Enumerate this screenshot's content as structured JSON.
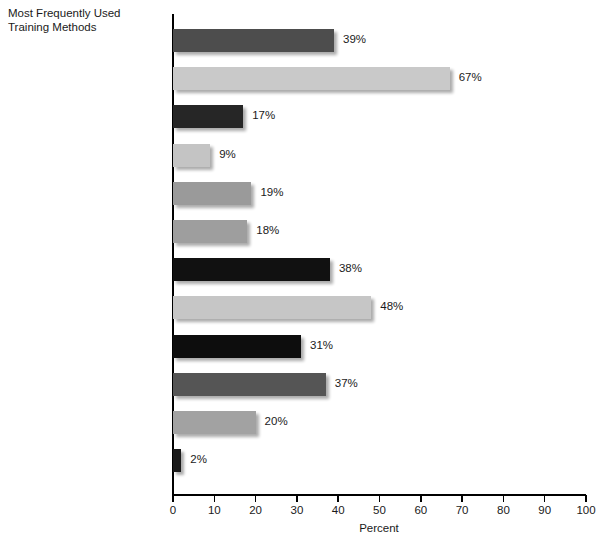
{
  "chart_data": {
    "type": "bar",
    "orientation": "horizontal",
    "title": "Most Frequently Used\nTraining Methods",
    "xlabel": "Percent",
    "ylabel": "",
    "xlim": [
      0,
      100
    ],
    "xticks": [
      0,
      10,
      20,
      30,
      40,
      50,
      60,
      70,
      80,
      90,
      100
    ],
    "xtick_labels": [
      "0",
      "10",
      "20",
      "30",
      "40",
      "50",
      "60",
      "70",
      "80",
      "90",
      "100"
    ],
    "grid": false,
    "legend": "none",
    "value_suffix": "%",
    "categories": [
      "Case studies",
      "Classroom w/ instructor,\ntraditional",
      "Classroom w/ instructor,\nvirtual",
      "Computer-based games",
      "Non-computer based games",
      "Experiential programs",
      "Performance support",
      "Public seminars",
      "Role playing",
      "Self-study, Web-based",
      "Self-study, non-computer",
      "Virtual reality programs"
    ],
    "values": [
      39,
      67,
      17,
      9,
      19,
      18,
      38,
      48,
      31,
      37,
      20,
      2
    ],
    "value_labels": [
      "39%",
      "67%",
      "17%",
      "9%",
      "19%",
      "18%",
      "38%",
      "48%",
      "31%",
      "37%",
      "20%",
      "2%"
    ],
    "bar_colors": [
      "#4d4d4d",
      "#c9c9c9",
      "#262626",
      "#c4c4c4",
      "#9a9a9a",
      "#9e9e9e",
      "#111111",
      "#c6c6c6",
      "#0d0d0d",
      "#555555",
      "#a2a2a2",
      "#1a1a1a"
    ]
  }
}
